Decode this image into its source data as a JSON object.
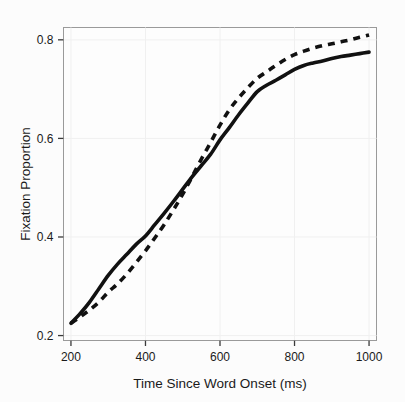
{
  "chart_data": {
    "type": "line",
    "title": "",
    "subtitle": "",
    "xlabel": "Time Since Word Onset (ms)",
    "ylabel": "Fixation Proportion",
    "xlim": [
      180,
      1020
    ],
    "ylim": [
      0.19,
      0.825
    ],
    "xticks": [
      200,
      400,
      600,
      800,
      1000
    ],
    "xtick_labels": [
      "200",
      "400",
      "600",
      "800",
      "1000"
    ],
    "yticks": [
      0.2,
      0.4,
      0.6,
      0.8
    ],
    "ytick_labels": [
      "0.2",
      "0.4",
      "0.6",
      "0.8"
    ],
    "grid": "faint",
    "legend": "none",
    "line_color": "#111111",
    "frame_color": "#9a9a9a",
    "background_color": "#fdfdfd",
    "x": [
      200,
      225,
      250,
      275,
      300,
      325,
      350,
      375,
      400,
      425,
      450,
      475,
      500,
      525,
      550,
      575,
      600,
      625,
      650,
      675,
      700,
      725,
      750,
      775,
      800,
      825,
      850,
      875,
      900,
      925,
      950,
      975,
      1000
    ],
    "series": [
      {
        "name": "solid",
        "style": "solid",
        "values": [
          0.225,
          0.245,
          0.268,
          0.295,
          0.322,
          0.345,
          0.365,
          0.385,
          0.402,
          0.425,
          0.448,
          0.472,
          0.497,
          0.522,
          0.545,
          0.568,
          0.597,
          0.622,
          0.648,
          0.672,
          0.695,
          0.708,
          0.718,
          0.729,
          0.74,
          0.748,
          0.753,
          0.757,
          0.762,
          0.766,
          0.769,
          0.772,
          0.775
        ]
      },
      {
        "name": "dashed",
        "style": "dashed",
        "values": [
          0.225,
          0.238,
          0.252,
          0.268,
          0.288,
          0.305,
          0.325,
          0.348,
          0.372,
          0.398,
          0.425,
          0.455,
          0.487,
          0.522,
          0.558,
          0.592,
          0.627,
          0.658,
          0.682,
          0.703,
          0.722,
          0.735,
          0.748,
          0.76,
          0.77,
          0.777,
          0.783,
          0.788,
          0.792,
          0.796,
          0.8,
          0.805,
          0.81
        ]
      }
    ],
    "annotations": []
  }
}
